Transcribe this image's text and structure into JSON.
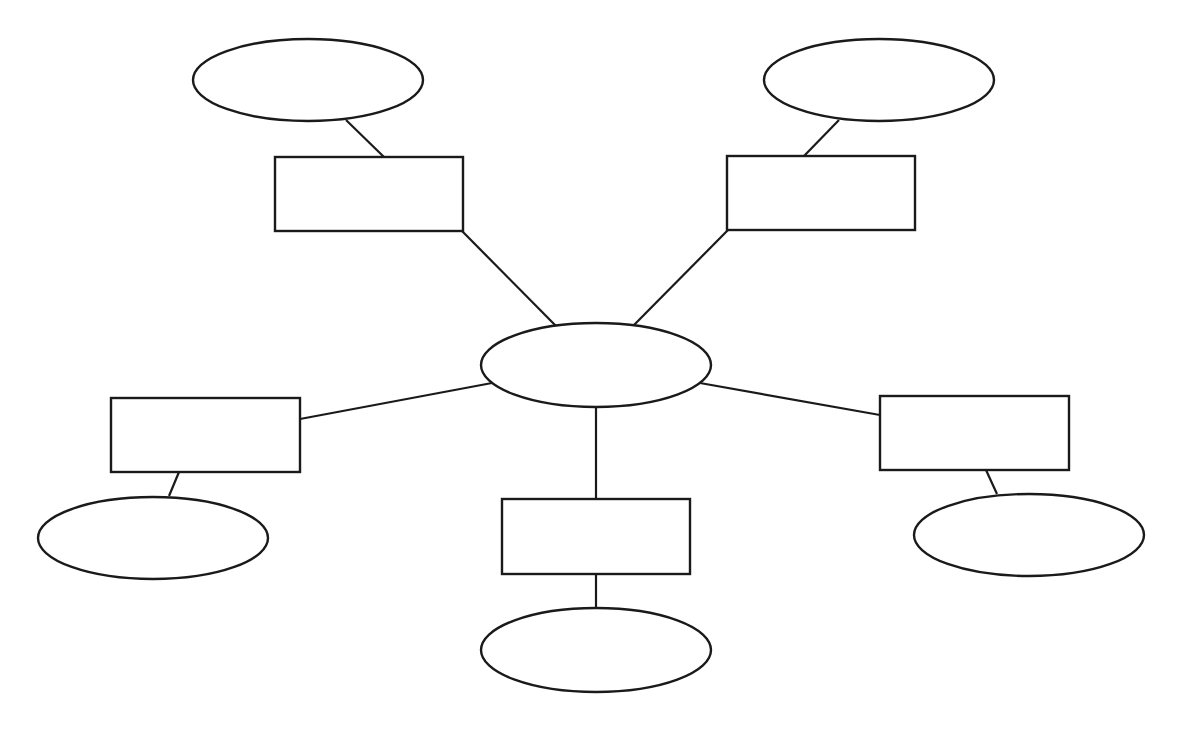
{
  "diagram": {
    "type": "spider-map",
    "colors": {
      "stroke": "#1a1a1a",
      "fill": "#ffffff",
      "background": "#ffffff"
    },
    "center": {
      "id": "center",
      "shape": "ellipse",
      "cx": 596,
      "cy": 365,
      "rx": 115,
      "ry": 42,
      "label": ""
    },
    "branches": [
      {
        "id": "top-left",
        "box": {
          "x": 275,
          "y": 157,
          "w": 188,
          "h": 74,
          "label": ""
        },
        "oval": {
          "cx": 308,
          "cy": 80,
          "rx": 115,
          "ry": 41,
          "label": ""
        },
        "center_edge": [
          [
            462,
            231
          ],
          [
            556,
            326
          ]
        ],
        "oval_edge": [
          [
            346,
            120
          ],
          [
            384,
            157
          ]
        ]
      },
      {
        "id": "top-right",
        "box": {
          "x": 727,
          "y": 156,
          "w": 188,
          "h": 74,
          "label": ""
        },
        "oval": {
          "cx": 879,
          "cy": 80,
          "rx": 115,
          "ry": 41,
          "label": ""
        },
        "center_edge": [
          [
            728,
            230
          ],
          [
            634,
            325
          ]
        ],
        "oval_edge": [
          [
            839,
            120
          ],
          [
            804,
            156
          ]
        ]
      },
      {
        "id": "left",
        "box": {
          "x": 111,
          "y": 398,
          "w": 189,
          "h": 74,
          "label": ""
        },
        "oval": {
          "cx": 153,
          "cy": 538,
          "rx": 115,
          "ry": 41,
          "label": ""
        },
        "center_edge": [
          [
            300,
            419
          ],
          [
            492,
            383
          ]
        ],
        "oval_edge": [
          [
            179,
            472
          ],
          [
            169,
            496
          ]
        ]
      },
      {
        "id": "bottom",
        "box": {
          "x": 502,
          "y": 499,
          "w": 188,
          "h": 75,
          "label": ""
        },
        "oval": {
          "cx": 596,
          "cy": 650,
          "rx": 115,
          "ry": 42,
          "label": ""
        },
        "center_edge": [
          [
            596,
            407
          ],
          [
            596,
            499
          ]
        ],
        "oval_edge": [
          [
            596,
            574
          ],
          [
            596,
            608
          ]
        ]
      },
      {
        "id": "right",
        "box": {
          "x": 880,
          "y": 396,
          "w": 189,
          "h": 74,
          "label": ""
        },
        "oval": {
          "cx": 1029,
          "cy": 535,
          "rx": 115,
          "ry": 41,
          "label": ""
        },
        "center_edge": [
          [
            700,
            383
          ],
          [
            880,
            415
          ]
        ],
        "oval_edge": [
          [
            986,
            470
          ],
          [
            997,
            494
          ]
        ]
      }
    ]
  }
}
